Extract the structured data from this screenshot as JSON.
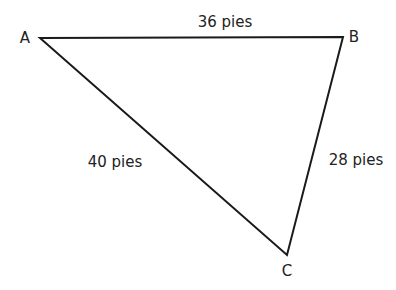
{
  "diagram": {
    "type": "triangle",
    "vertices": [
      {
        "name": "A",
        "x": 40,
        "y": 38,
        "label_x": 25,
        "label_y": 43
      },
      {
        "name": "B",
        "x": 343,
        "y": 37,
        "label_x": 354,
        "label_y": 42
      },
      {
        "name": "C",
        "x": 287,
        "y": 255,
        "label_x": 287,
        "label_y": 276
      }
    ],
    "sides": [
      {
        "from": "A",
        "to": "B",
        "label": "36 pies",
        "label_x": 225,
        "label_y": 27
      },
      {
        "from": "A",
        "to": "C",
        "label": "40 pies",
        "label_x": 115,
        "label_y": 167
      },
      {
        "from": "B",
        "to": "C",
        "label": "28 pies",
        "label_x": 356,
        "label_y": 165
      }
    ],
    "stroke_color": "#1a1a1a",
    "text_color": "#222222"
  }
}
